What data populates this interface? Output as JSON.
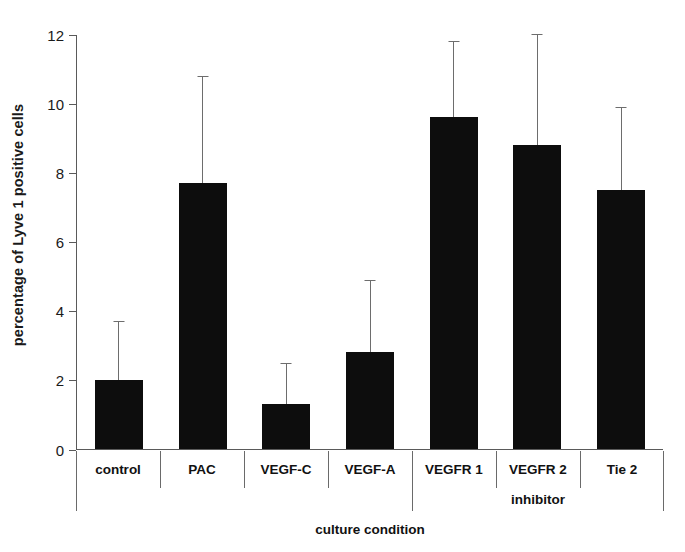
{
  "chart_data": {
    "type": "bar",
    "title": "",
    "subtitle": "",
    "xlabel": "culture condition",
    "ylabel": "percentage of Lyve 1 positive cells",
    "categories": [
      "control",
      "PAC",
      "VEGF-C",
      "VEGF-A",
      "VEGFR 1",
      "VEGFR 2",
      "Tie 2"
    ],
    "values": [
      2.0,
      7.7,
      1.3,
      2.8,
      9.6,
      8.8,
      7.5
    ],
    "errors_upper": [
      3.7,
      10.8,
      2.5,
      4.9,
      11.8,
      12.0,
      9.9
    ],
    "error_type": "upper-only",
    "ylim": [
      0,
      12
    ],
    "yticks": [
      0,
      2,
      4,
      6,
      8,
      10,
      12
    ],
    "ytick_labels": [
      "0",
      "2",
      "4",
      "6",
      "8",
      "10",
      "12"
    ],
    "grid": false,
    "legend": null,
    "bar_color": "#0d0d0d",
    "error_color": "#6d6d6d",
    "axis_color": "#5a5a5a",
    "groups": [
      {
        "label": "inhibitor",
        "categories": [
          "VEGFR 1",
          "VEGFR 2",
          "Tie 2"
        ]
      }
    ]
  }
}
